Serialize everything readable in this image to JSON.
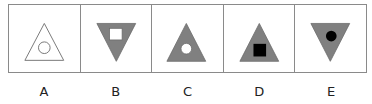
{
  "colors": {
    "border": "#8a8a8a",
    "outline": "#777777",
    "gray_fill": "#808080",
    "white": "#ffffff",
    "black": "#000000"
  },
  "options": [
    {
      "label": "A",
      "outer": "triangle-up",
      "outer_fill": "none",
      "inner": "circle",
      "inner_fill": "none"
    },
    {
      "label": "B",
      "outer": "triangle-down",
      "outer_fill": "gray",
      "inner": "square",
      "inner_fill": "white"
    },
    {
      "label": "C",
      "outer": "triangle-up",
      "outer_fill": "gray",
      "inner": "circle",
      "inner_fill": "white"
    },
    {
      "label": "D",
      "outer": "triangle-up",
      "outer_fill": "gray",
      "inner": "square",
      "inner_fill": "black"
    },
    {
      "label": "E",
      "outer": "triangle-down",
      "outer_fill": "gray",
      "inner": "circle",
      "inner_fill": "black"
    }
  ]
}
